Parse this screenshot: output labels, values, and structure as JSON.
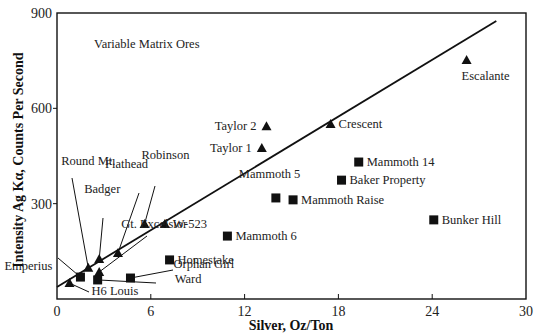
{
  "chart_data": {
    "type": "scatter",
    "title": "",
    "annotation": "Variable Matrix Ores",
    "xlabel": "Silver, Oz/Ton",
    "ylabel": "Intensity Ag Kα, Counts Per Second",
    "xlim": [
      0,
      30
    ],
    "ylim": [
      0,
      900
    ],
    "x_ticks": [
      0,
      6,
      12,
      18,
      24,
      30
    ],
    "y_ticks": [
      0,
      300,
      600,
      900
    ],
    "x_tick_labels": [
      "0",
      "6",
      "12",
      "18",
      "24",
      "30"
    ],
    "y_tick_labels": [
      "",
      "300",
      "600",
      "900"
    ],
    "grid": false,
    "legend": null,
    "fit_line": {
      "x": [
        0,
        28.1
      ],
      "y": [
        38,
        875
      ]
    },
    "series": [
      {
        "name": "triangles",
        "marker": "triangle",
        "points": [
          {
            "label": "Escalante",
            "x": 26.2,
            "y": 752
          },
          {
            "label": "Crescent",
            "x": 17.5,
            "y": 551
          },
          {
            "label": "Taylor 2",
            "x": 13.4,
            "y": 544
          },
          {
            "label": "Taylor 1",
            "x": 13.1,
            "y": 475
          },
          {
            "label": "Robinson",
            "x": 5.6,
            "y": 236
          },
          {
            "label": "W-523",
            "x": 6.9,
            "y": 236
          },
          {
            "label": "Flathead",
            "x": 3.9,
            "y": 145
          },
          {
            "label": "Badger",
            "x": 2.7,
            "y": 126
          },
          {
            "label": "Round Mt.",
            "x": 2.0,
            "y": 98
          },
          {
            "label": "Gt. Excelsior",
            "x": 2.7,
            "y": 85
          },
          {
            "label": "H6 Louis",
            "x": 0.8,
            "y": 50
          }
        ]
      },
      {
        "name": "squares",
        "marker": "square",
        "points": [
          {
            "label": "Emperius",
            "x": 1.5,
            "y": 69
          },
          {
            "label": "Ward",
            "x": 2.6,
            "y": 60
          },
          {
            "label": "Orphan Girl",
            "x": 4.7,
            "y": 66
          },
          {
            "label": "Homestake",
            "x": 7.2,
            "y": 123
          },
          {
            "label": "Mammoth 6",
            "x": 10.9,
            "y": 198
          },
          {
            "label": "Mammoth 5",
            "x": 14.0,
            "y": 318
          },
          {
            "label": "Mammoth Raise",
            "x": 15.1,
            "y": 312
          },
          {
            "label": "Baker Property",
            "x": 18.2,
            "y": 374
          },
          {
            "label": "Mammoth 14",
            "x": 19.3,
            "y": 431
          },
          {
            "label": "Bunker Hill",
            "x": 24.1,
            "y": 249
          }
        ]
      }
    ]
  },
  "labels": {
    "annotation": "Variable Matrix Ores",
    "xlabel": "Silver, Oz/Ton",
    "ylabel": "Intensity Ag Kα, Counts Per Second"
  },
  "colors": {
    "ink": "#111111",
    "background": "#ffffff"
  }
}
